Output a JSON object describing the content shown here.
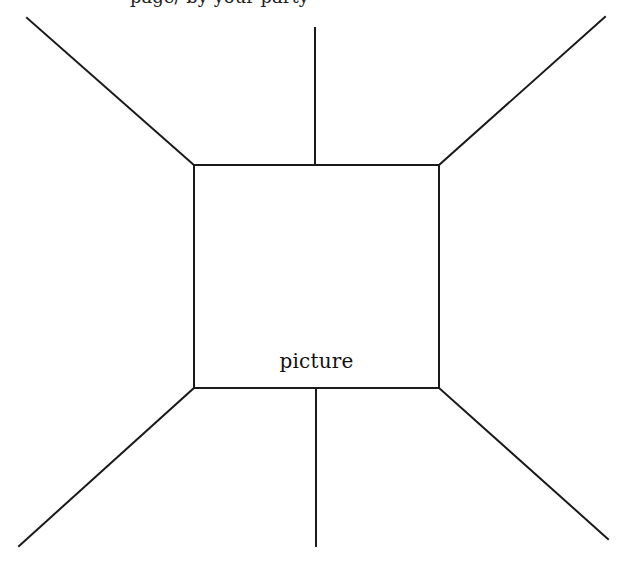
{
  "diagram": {
    "type": "perspective-room-sketch",
    "stroke_color": "#1a1a1a",
    "background": "#ffffff",
    "top_clipped_text": "page/ by your party",
    "center_box": {
      "label": "picture",
      "x": 194,
      "y": 165,
      "width": 245,
      "height": 223
    },
    "lines": [
      {
        "name": "top-left-diagonal",
        "x1": 27,
        "y1": 18,
        "x2": 194,
        "y2": 165
      },
      {
        "name": "top-center-vertical",
        "x1": 315,
        "y1": 28,
        "x2": 315,
        "y2": 165
      },
      {
        "name": "top-right-diagonal",
        "x1": 439,
        "y1": 165,
        "x2": 605,
        "y2": 17
      },
      {
        "name": "bottom-left-diagonal",
        "x1": 194,
        "y1": 388,
        "x2": 19,
        "y2": 546
      },
      {
        "name": "bottom-center-vertical",
        "x1": 316,
        "y1": 388,
        "x2": 316,
        "y2": 546
      },
      {
        "name": "bottom-right-diagonal",
        "x1": 439,
        "y1": 388,
        "x2": 608,
        "y2": 539
      }
    ]
  }
}
